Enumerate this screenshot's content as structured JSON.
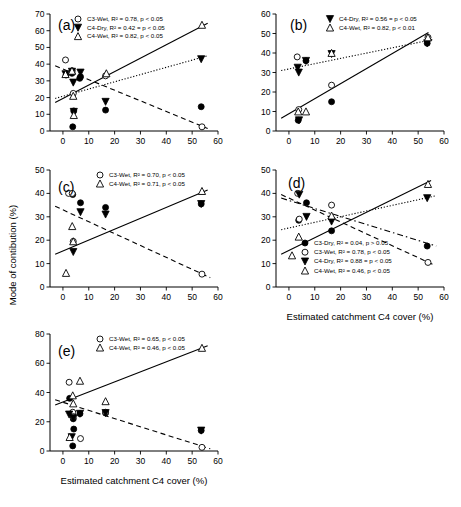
{
  "figure": {
    "axis_titles": {
      "x": "Estimated catchment C4 cover (%)",
      "y": "Mode of contibution (%)"
    },
    "series_names": {
      "c3_dry": "C3-Dry",
      "c3_wet": "C3-Wet",
      "c4_dry": "C4-Dry",
      "c4_wet": "C4-Wet"
    }
  },
  "chart_data": [
    {
      "id": "a",
      "type": "scatter",
      "panel_label": "(a)",
      "title": "",
      "xlabel": "",
      "ylabel": "",
      "xlim": [
        -5,
        60
      ],
      "ylim": [
        0,
        70
      ],
      "xticks": [
        0,
        10,
        20,
        30,
        40,
        50,
        60
      ],
      "yticks": [
        0,
        10,
        20,
        30,
        40,
        50,
        60,
        70
      ],
      "grid": false,
      "legend_position": "top-left",
      "legend": [
        {
          "marker": "circle-open",
          "label": "C3-Wet, R² = 0.78, p < 0.05"
        },
        {
          "marker": "triangle-down-filled",
          "label": "C4-Dry, R² = 0.42 = p < 0.05"
        },
        {
          "marker": "triangle-up-open",
          "label": "C4-Wet, R² = 0.82, p < 0.05"
        }
      ],
      "series": [
        {
          "name": "C3-Dry",
          "marker": "circle-filled",
          "points": [
            [
              1.2,
              33.5
            ],
            [
              3.5,
              34.5
            ],
            [
              3.8,
              2.5
            ],
            [
              4.2,
              12.0
            ],
            [
              6.5,
              31.5
            ],
            [
              6.8,
              32.5
            ],
            [
              16.5,
              12.5
            ],
            [
              53.5,
              14.5
            ]
          ]
        },
        {
          "name": "C3-Wet",
          "marker": "circle-open",
          "points": [
            [
              1.0,
              42.5
            ],
            [
              3.6,
              36.0
            ],
            [
              4.0,
              22.5
            ],
            [
              16.5,
              33.0
            ],
            [
              53.8,
              2.5
            ]
          ]
        },
        {
          "name": "C4-Dry",
          "marker": "triangle-down-filled",
          "points": [
            [
              1.0,
              34.0
            ],
            [
              3.5,
              35.5
            ],
            [
              4.0,
              29.0
            ],
            [
              4.2,
              11.5
            ],
            [
              6.8,
              35.0
            ],
            [
              16.5,
              17.5
            ],
            [
              53.5,
              43.0
            ]
          ]
        },
        {
          "name": "C4-Wet",
          "marker": "triangle-up-open",
          "points": [
            [
              1.0,
              34.0
            ],
            [
              3.5,
              36.0
            ],
            [
              4.0,
              21.0
            ],
            [
              4.2,
              9.5
            ],
            [
              16.8,
              34.5
            ],
            [
              53.8,
              63.5
            ]
          ]
        }
      ],
      "fits": [
        {
          "name": "C4-Wet",
          "style": "solid",
          "x": [
            -3,
            56
          ],
          "y": [
            17.0,
            64.5
          ]
        },
        {
          "name": "C4-Dry",
          "style": "dotted",
          "x": [
            -3,
            56
          ],
          "y": [
            19.5,
            45.0
          ]
        },
        {
          "name": "C3-Wet",
          "style": "dashed",
          "x": [
            -3,
            56
          ],
          "y": [
            39.0,
            1.5
          ]
        }
      ]
    },
    {
      "id": "b",
      "type": "scatter",
      "panel_label": "(b)",
      "xlim": [
        -5,
        60
      ],
      "ylim": [
        0,
        60
      ],
      "xticks": [
        0,
        10,
        20,
        30,
        40,
        50,
        60
      ],
      "yticks": [
        0,
        10,
        20,
        30,
        40,
        50,
        60
      ],
      "grid": false,
      "legend_position": "top-center",
      "legend": [
        {
          "marker": "triangle-down-filled",
          "label": "C4-Dry, R² = 0.56 = p < 0.05"
        },
        {
          "marker": "triangle-up-open",
          "label": "C4-Wet, R² = 0.82, p < 0.01"
        }
      ],
      "series": [
        {
          "name": "C3-Dry",
          "marker": "circle-filled",
          "points": [
            [
              3.6,
              5.5
            ],
            [
              6.6,
              36.0
            ],
            [
              16.5,
              15.0
            ],
            [
              53.5,
              45.0
            ]
          ]
        },
        {
          "name": "C3-Wet",
          "marker": "circle-open",
          "points": [
            [
              3.2,
              38.0
            ],
            [
              3.8,
              11.0
            ],
            [
              16.5,
              23.5
            ],
            [
              53.8,
              48.0
            ]
          ]
        },
        {
          "name": "C4-Dry",
          "marker": "triangle-down-filled",
          "points": [
            [
              3.4,
              32.5
            ],
            [
              3.8,
              30.0
            ],
            [
              3.9,
              5.5
            ],
            [
              6.6,
              36.0
            ],
            [
              16.5,
              39.5
            ],
            [
              53.5,
              45.0
            ]
          ]
        },
        {
          "name": "C4-Wet",
          "marker": "triangle-up-open",
          "points": [
            [
              3.6,
              10.0
            ],
            [
              6.6,
              10.0
            ],
            [
              16.5,
              40.0
            ],
            [
              53.8,
              48.0
            ]
          ]
        }
      ],
      "fits": [
        {
          "name": "C4-Dry",
          "style": "dotted",
          "x": [
            -3,
            56
          ],
          "y": [
            31.0,
            47.0
          ]
        },
        {
          "name": "C4-Wet",
          "style": "solid",
          "x": [
            -3,
            54
          ],
          "y": [
            6.5,
            50.5
          ]
        }
      ]
    },
    {
      "id": "c",
      "type": "scatter",
      "panel_label": "(c)",
      "xlim": [
        -5,
        60
      ],
      "ylim": [
        0,
        50
      ],
      "xticks": [
        0,
        10,
        20,
        30,
        40,
        50,
        60
      ],
      "yticks": [
        0,
        10,
        20,
        30,
        40,
        50
      ],
      "grid": false,
      "legend_position": "top-center",
      "legend": [
        {
          "marker": "circle-open",
          "label": "C3-Wet, R² = 0.70, p < 0.05"
        },
        {
          "marker": "triangle-up-open",
          "label": "C4-Wet, R² = 0.71, p < 0.05"
        }
      ],
      "series": [
        {
          "name": "C3-Dry",
          "marker": "circle-filled",
          "points": [
            [
              3.8,
              39.5
            ],
            [
              6.8,
              36.0
            ],
            [
              16.5,
              34.0
            ],
            [
              53.5,
              35.5
            ]
          ]
        },
        {
          "name": "C3-Wet",
          "marker": "circle-open",
          "points": [
            [
              2.2,
              40.0
            ],
            [
              3.6,
              40.0
            ],
            [
              4.0,
              19.5
            ],
            [
              53.8,
              5.5
            ]
          ]
        },
        {
          "name": "C4-Dry",
          "marker": "triangle-down-filled",
          "points": [
            [
              4.0,
              15.0
            ],
            [
              6.8,
              32.0
            ],
            [
              16.5,
              31.0
            ],
            [
              53.5,
              35.5
            ]
          ]
        },
        {
          "name": "C4-Wet",
          "marker": "triangle-up-open",
          "points": [
            [
              1.2,
              6.0
            ],
            [
              3.6,
              26.0
            ],
            [
              4.0,
              19.5
            ],
            [
              53.8,
              41.0
            ]
          ]
        }
      ],
      "fits": [
        {
          "name": "C4-Wet",
          "style": "solid",
          "x": [
            -3,
            56
          ],
          "y": [
            14.0,
            41.5
          ]
        },
        {
          "name": "C3-Wet",
          "style": "dashed",
          "x": [
            -3,
            57
          ],
          "y": [
            34.5,
            4.0
          ]
        }
      ]
    },
    {
      "id": "d",
      "type": "scatter",
      "panel_label": "(d)",
      "xlim": [
        -5,
        60
      ],
      "ylim": [
        0,
        50
      ],
      "xticks": [
        0,
        10,
        20,
        30,
        40,
        50,
        60
      ],
      "yticks": [
        0,
        10,
        20,
        30,
        40,
        50
      ],
      "grid": false,
      "legend_position": "bottom-center",
      "legend": [
        {
          "marker": "circle-filled",
          "label": "C3-Dry, R² = 0.04, p > 0.05"
        },
        {
          "marker": "circle-open",
          "label": "C3-Wet, R² = 0.78, p < 0.05"
        },
        {
          "marker": "triangle-down-filled",
          "label": "C4-Dry, R² = 0.88 = p < 0.05"
        },
        {
          "marker": "triangle-up-open",
          "label": "C4-Wet, R² = 0.46, p < 0.05"
        }
      ],
      "series": [
        {
          "name": "C3-Dry",
          "marker": "circle-filled",
          "points": [
            [
              3.8,
              28.5
            ],
            [
              6.8,
              36.0
            ],
            [
              16.5,
              24.0
            ],
            [
              53.5,
              17.5
            ]
          ]
        },
        {
          "name": "C3-Wet",
          "marker": "circle-open",
          "points": [
            [
              3.4,
              40.0
            ],
            [
              4.0,
              29.0
            ],
            [
              16.5,
              35.0
            ],
            [
              53.8,
              10.5
            ]
          ]
        },
        {
          "name": "C4-Dry",
          "marker": "triangle-down-filled",
          "points": [
            [
              4.0,
              39.5
            ],
            [
              6.8,
              30.0
            ],
            [
              16.5,
              28.0
            ],
            [
              53.5,
              38.0
            ]
          ]
        },
        {
          "name": "C4-Wet",
          "marker": "triangle-up-open",
          "points": [
            [
              1.2,
              13.5
            ],
            [
              3.8,
              21.5
            ],
            [
              16.5,
              30.5
            ],
            [
              53.8,
              44.0
            ]
          ]
        }
      ],
      "fits": [
        {
          "name": "C4-Wet",
          "style": "solid",
          "x": [
            -3,
            55
          ],
          "y": [
            14.0,
            45.5
          ]
        },
        {
          "name": "C4-Dry",
          "style": "dotted",
          "x": [
            -3,
            57
          ],
          "y": [
            24.5,
            39.0
          ]
        },
        {
          "name": "C3-Dry",
          "style": "dashdot",
          "x": [
            -3,
            57
          ],
          "y": [
            38.0,
            17.5
          ]
        },
        {
          "name": "C3-Wet",
          "style": "dashed",
          "x": [
            -3,
            56
          ],
          "y": [
            39.5,
            9.5
          ]
        }
      ]
    },
    {
      "id": "e",
      "type": "scatter",
      "panel_label": "(e)",
      "xlim": [
        -5,
        60
      ],
      "ylim": [
        0,
        80
      ],
      "xticks": [
        0,
        10,
        20,
        30,
        40,
        50,
        60
      ],
      "yticks": [
        0,
        20,
        40,
        60,
        80
      ],
      "grid": false,
      "legend_position": "top-center",
      "legend": [
        {
          "marker": "circle-open",
          "label": "C3-Wet, R² = 0.65, p < 0.05"
        },
        {
          "marker": "triangle-up-open",
          "label": "C4-Wet, R² = 0.46, p < 0.05"
        }
      ],
      "series": [
        {
          "name": "C3-Dry",
          "marker": "circle-filled",
          "points": [
            [
              2.6,
              36.0
            ],
            [
              3.8,
              3.5
            ],
            [
              4.0,
              22.0
            ],
            [
              4.2,
              15.0
            ],
            [
              6.6,
              25.5
            ],
            [
              16.5,
              26.0
            ],
            [
              53.5,
              14.0
            ]
          ]
        },
        {
          "name": "C3-Wet",
          "marker": "circle-open",
          "points": [
            [
              2.4,
              47.0
            ],
            [
              3.8,
              26.5
            ],
            [
              4.0,
              23.5
            ],
            [
              6.8,
              8.5
            ],
            [
              16.5,
              26.5
            ],
            [
              53.8,
              2.5
            ]
          ]
        },
        {
          "name": "C4-Dry",
          "marker": "triangle-down-filled",
          "points": [
            [
              2.4,
              25.0
            ],
            [
              3.4,
              9.5
            ],
            [
              4.0,
              22.5
            ],
            [
              6.6,
              25.5
            ],
            [
              16.5,
              26.0
            ],
            [
              53.5,
              14.0
            ]
          ]
        },
        {
          "name": "C4-Wet",
          "marker": "triangle-up-open",
          "points": [
            [
              2.6,
              9.5
            ],
            [
              3.8,
              38.0
            ],
            [
              4.0,
              32.5
            ],
            [
              6.6,
              48.0
            ],
            [
              16.5,
              34.0
            ],
            [
              53.8,
              70.5
            ]
          ]
        }
      ],
      "fits": [
        {
          "name": "C3-Wet",
          "style": "solid",
          "x": [
            -3,
            56
          ],
          "y": [
            31.5,
            72.0
          ]
        },
        {
          "name": "C4-Wet",
          "style": "dashed",
          "x": [
            -3,
            57
          ],
          "y": [
            35.0,
            1.5
          ]
        }
      ]
    }
  ]
}
